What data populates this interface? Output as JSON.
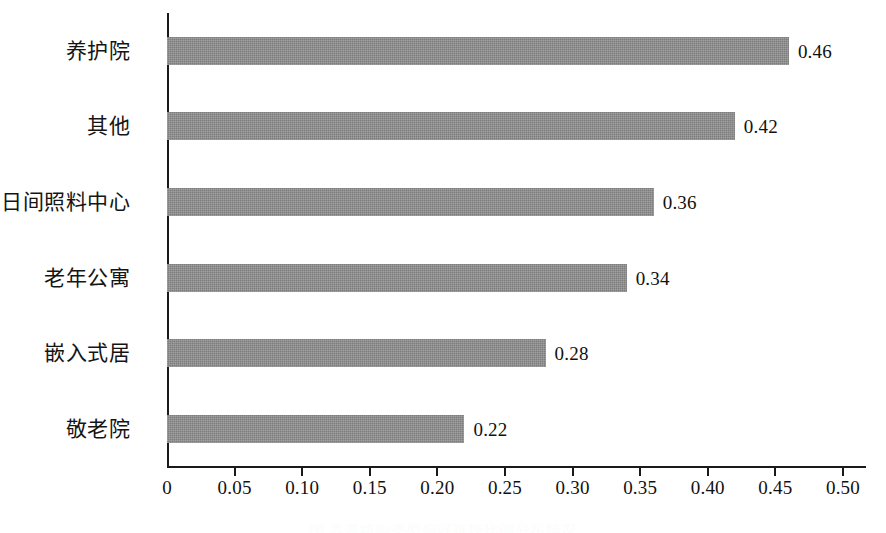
{
  "chart_data": {
    "type": "bar",
    "orientation": "horizontal",
    "title": "",
    "subtitle": "",
    "xlabel": "",
    "ylabel": "",
    "categories": [
      "养护院",
      "其他",
      "日间照料中心",
      "老年公寓",
      "嵌入式居",
      "敬老院"
    ],
    "values": [
      0.46,
      0.42,
      0.36,
      0.34,
      0.28,
      0.22
    ],
    "value_labels": [
      "0.46",
      "0.42",
      "0.36",
      "0.34",
      "0.28",
      "0.22"
    ],
    "series": [
      {
        "name": "",
        "values": [
          0.46,
          0.42,
          0.36,
          0.34,
          0.28,
          0.22
        ]
      }
    ],
    "xlim": [
      0,
      0.5
    ],
    "ylim": null,
    "x_ticks": [
      0,
      0.05,
      0.1,
      0.15,
      0.2,
      0.25,
      0.3,
      0.35,
      0.4,
      0.45,
      0.5
    ],
    "x_tick_labels": [
      "0",
      "0.05",
      "0.10",
      "0.15",
      "0.20",
      "0.25",
      "0.30",
      "0.35",
      "0.40",
      "0.45",
      "0.50"
    ],
    "grid": false,
    "legend": null,
    "legend_position": "none",
    "annotations": [],
    "colors": {
      "bar": "#8a8a8a",
      "axis": "#1a1a1a",
      "text": "#111111",
      "background": "#ffffff"
    }
  },
  "caption": {
    "text": "图 养老机构类型偏好选择比例分布情况",
    "visible": "partially-cropped"
  }
}
